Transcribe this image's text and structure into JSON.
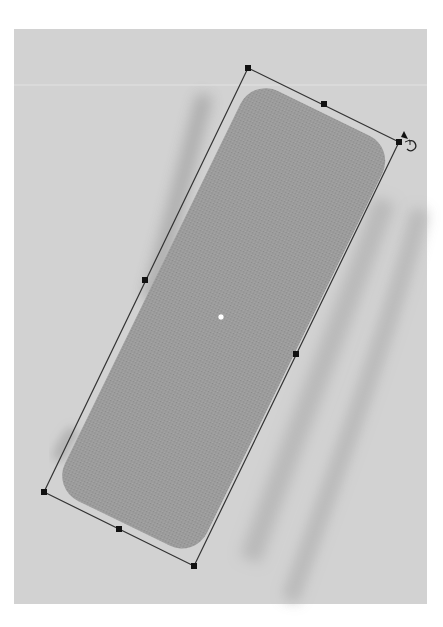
{
  "canvas": {
    "background": "#d2d2d2",
    "bounds": {
      "x": 14,
      "y": 29,
      "width": 413,
      "height": 575
    }
  },
  "shape": {
    "type": "rounded-rectangle",
    "fill": "#9a9a9a",
    "center": {
      "x": 221,
      "y": 317
    },
    "rotation_deg": 26,
    "selected": true
  },
  "selection": {
    "stroke": "#333333",
    "corners": [
      {
        "name": "top-left",
        "x": 248,
        "y": 68
      },
      {
        "name": "top-right",
        "x": 399,
        "y": 142
      },
      {
        "name": "bottom-right",
        "x": 194,
        "y": 566
      },
      {
        "name": "bottom-left",
        "x": 44,
        "y": 492
      }
    ],
    "edge_midpoints": [
      {
        "name": "top",
        "x": 324,
        "y": 104
      },
      {
        "name": "right",
        "x": 296,
        "y": 354
      },
      {
        "name": "bottom",
        "x": 119,
        "y": 529
      },
      {
        "name": "left",
        "x": 145,
        "y": 280
      }
    ],
    "center_handle": {
      "x": 221,
      "y": 317
    }
  },
  "cursor": {
    "type": "rotate-cursor",
    "x": 408,
    "y": 140
  }
}
